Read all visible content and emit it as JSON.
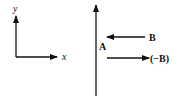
{
  "diagram": {
    "axes": {
      "y_label": "y",
      "x_label": "x"
    },
    "vectors": [
      {
        "id": "A",
        "label": "A",
        "direction": "up"
      },
      {
        "id": "B",
        "label": "B",
        "direction": "left"
      },
      {
        "id": "negB",
        "label": "(−B)",
        "direction": "right"
      }
    ],
    "colors": {
      "stroke": "#111111",
      "background": "#ffffff"
    }
  }
}
